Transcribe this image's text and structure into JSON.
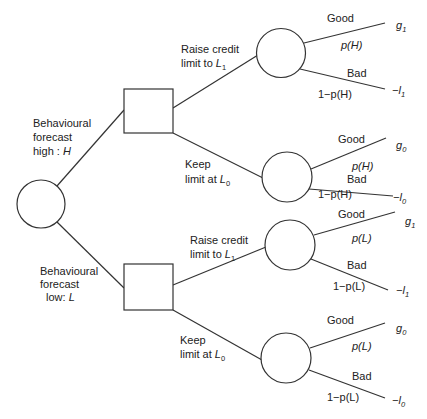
{
  "diagram": {
    "type": "decision-tree",
    "root": {
      "kind": "chance",
      "branches": [
        {
          "label_lines": [
            "Behavioural",
            "forecast"
          ],
          "label_last_prefix": "high : ",
          "label_last_var": "H",
          "decision": {
            "kind": "decision",
            "options": [
              {
                "label_line1": "Raise credit",
                "label_line2_prefix": "limit to ",
                "label_var": "L",
                "label_sub": "1",
                "outcomes": [
                  {
                    "name": "Good",
                    "prob": "p(H)",
                    "value_sign": "",
                    "value_var": "g",
                    "value_sub": "1"
                  },
                  {
                    "name": "Bad",
                    "prob": "1−p(H)",
                    "value_sign": "−",
                    "value_var": "l",
                    "value_sub": "1"
                  }
                ]
              },
              {
                "label_line1": "Keep",
                "label_line2_prefix": "limit at ",
                "label_var": "L",
                "label_sub": "0",
                "outcomes": [
                  {
                    "name": "Good",
                    "prob": "p(H)",
                    "value_sign": "",
                    "value_var": "g",
                    "value_sub": "0"
                  },
                  {
                    "name": "Bad",
                    "prob": "1−p(H)",
                    "value_sign": "−",
                    "value_var": "l",
                    "value_sub": "0"
                  }
                ]
              }
            ]
          }
        },
        {
          "label_lines": [
            "Behavioural",
            "forecast"
          ],
          "label_last_prefix": "low: ",
          "label_last_var": "L",
          "decision": {
            "kind": "decision",
            "options": [
              {
                "label_line1": "Raise credit",
                "label_line2_prefix": "limit to ",
                "label_var": "L",
                "label_sub": "1",
                "outcomes": [
                  {
                    "name": "Good",
                    "prob": "p(L)",
                    "value_sign": "",
                    "value_var": "g",
                    "value_sub": "1"
                  },
                  {
                    "name": "Bad",
                    "prob": "1−p(L)",
                    "value_sign": "−",
                    "value_var": "l",
                    "value_sub": "1"
                  }
                ]
              },
              {
                "label_line1": "Keep",
                "label_line2_prefix": "limit at ",
                "label_var": "L",
                "label_sub": "0",
                "outcomes": [
                  {
                    "name": "Good",
                    "prob": "p(L)",
                    "value_sign": "",
                    "value_var": "g",
                    "value_sub": "0"
                  },
                  {
                    "name": "Bad",
                    "prob": "1−p(L)",
                    "value_sign": "−",
                    "value_var": "l",
                    "value_sub": "0"
                  }
                ]
              }
            ]
          }
        }
      ]
    }
  }
}
